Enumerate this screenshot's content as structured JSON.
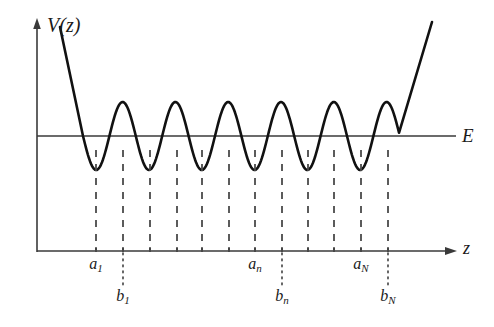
{
  "figure": {
    "type": "potential-well-diagram",
    "background_color": "#ffffff",
    "curve_color": "#111111",
    "axis_color": "#3a3a3a",
    "dash_color": "#4a4a4a"
  },
  "axes": {
    "y_axis": {
      "label": "V(z)",
      "x_px": 37,
      "top_px": 20,
      "bottom_px": 252
    },
    "x_axis": {
      "label": "z",
      "y_px": 251,
      "left_px": 37,
      "right_px": 457
    },
    "energy_line": {
      "label": "E",
      "y_px": 136,
      "left_px": 37,
      "right_px": 456
    }
  },
  "chart_data": {
    "type": "line",
    "title": "",
    "xlabel": "z",
    "ylabel": "V(z)",
    "legend": [
      "V(z)",
      "E"
    ],
    "annotations": [
      "a_1",
      "b_1",
      "a_n",
      "b_n",
      "a_N",
      "b_N"
    ],
    "grid": false,
    "xlim": [
      0,
      494
    ],
    "ylim": [
      0,
      327
    ],
    "well_count": 6,
    "energy_level_y": 136,
    "curve_baseline_y": 136,
    "wave_amplitude_px": 34,
    "wave_start_x": 83,
    "wave_end_x": 399,
    "wave_period_px": 52.8,
    "left_wall": {
      "from": [
        60,
        27
      ],
      "to": [
        95,
        150
      ]
    },
    "right_wall": {
      "from": [
        392,
        152
      ],
      "to": [
        432,
        22
      ]
    },
    "turning_points_px": [
      96,
      123,
      150,
      177,
      202,
      229,
      255,
      282,
      308,
      334,
      361,
      388
    ],
    "dash_top_y": 150,
    "dash_bottom_y": 250,
    "dotted_top_y": 253,
    "dotted_bottom_y": 285
  },
  "labels": {
    "y_axis_label": "V(z)",
    "energy_label": "E",
    "x_axis_label": "z",
    "ticks": [
      {
        "name": "a-1",
        "base": "a",
        "sub": "1",
        "x_px": 96,
        "y_px": 256,
        "kind": "a"
      },
      {
        "name": "b-1",
        "base": "b",
        "sub": "1",
        "x_px": 123,
        "y_px": 288,
        "kind": "b"
      },
      {
        "name": "a-n",
        "base": "a",
        "sub": "n",
        "x_px": 255,
        "y_px": 256,
        "kind": "a"
      },
      {
        "name": "b-n",
        "base": "b",
        "sub": "n",
        "x_px": 282,
        "y_px": 288,
        "kind": "b"
      },
      {
        "name": "a-N",
        "base": "a",
        "sub": "N",
        "x_px": 361,
        "y_px": 256,
        "kind": "a"
      },
      {
        "name": "b-N",
        "base": "b",
        "sub": "N",
        "x_px": 388,
        "y_px": 288,
        "kind": "b"
      }
    ]
  }
}
